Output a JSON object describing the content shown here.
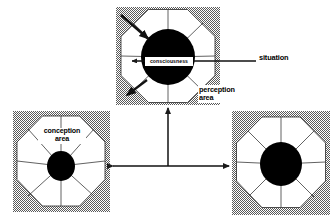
{
  "diagram": {
    "background_color": "#ffffff",
    "shade_color": "#8c8c8c",
    "line_color": "#1a1a1a",
    "fill_color": "#ffffff",
    "core_color": "#000000",
    "labels": {
      "consciousness": "consciousness",
      "situation": "situation",
      "perception_area": "perception\narea",
      "conception_area": "conception\narea"
    },
    "nodes": [
      {
        "id": "top",
        "name": "perception-node",
        "box": {
          "x": 116,
          "y": 7,
          "w": 104,
          "h": 98
        },
        "octagon": {
          "cx": 168,
          "cy": 56,
          "r": 47
        },
        "core": {
          "cx": 168,
          "cy": 57,
          "rx": 27,
          "ry": 28
        },
        "spokes": 8,
        "label": "perception area"
      },
      {
        "id": "left",
        "name": "conception-node",
        "box": {
          "x": 13,
          "y": 111,
          "w": 97,
          "h": 101
        },
        "octagon": {
          "cx": 61,
          "cy": 161,
          "r": 45
        },
        "core": {
          "cx": 61,
          "cy": 166,
          "rx": 14,
          "ry": 15
        },
        "spokes": 8,
        "label": "conception area"
      },
      {
        "id": "right",
        "name": "third-node",
        "box": {
          "x": 232,
          "y": 111,
          "w": 98,
          "h": 104
        },
        "octagon": {
          "cx": 281,
          "cy": 162,
          "r": 45
        },
        "core": {
          "cx": 281,
          "cy": 164,
          "rx": 21,
          "ry": 22
        },
        "spokes": 8,
        "label": ""
      }
    ],
    "connectors": [
      {
        "name": "vertical-arrow-to-top",
        "from": [
          168,
          166
        ],
        "to": [
          168,
          106
        ],
        "arrowheads": "end"
      },
      {
        "name": "horizontal-double-arrow",
        "from": [
          110,
          166
        ],
        "to": [
          232,
          166
        ],
        "arrowheads": "both"
      }
    ],
    "pointer_arrows": [
      {
        "name": "incoming-arrow-upper-left",
        "from": [
          121,
          15
        ],
        "to": [
          152,
          42
        ],
        "thick": true
      },
      {
        "name": "outgoing-arrow-lower-left",
        "from": [
          146,
          80
        ],
        "to": [
          124,
          97
        ],
        "thick": true
      },
      {
        "name": "inner-arrow-left",
        "from": [
          168,
          61
        ],
        "to": [
          130,
          61
        ],
        "thick": false
      },
      {
        "name": "situation-arrow",
        "from": [
          256,
          61
        ],
        "to": [
          173,
          61
        ],
        "thick": false
      }
    ]
  }
}
